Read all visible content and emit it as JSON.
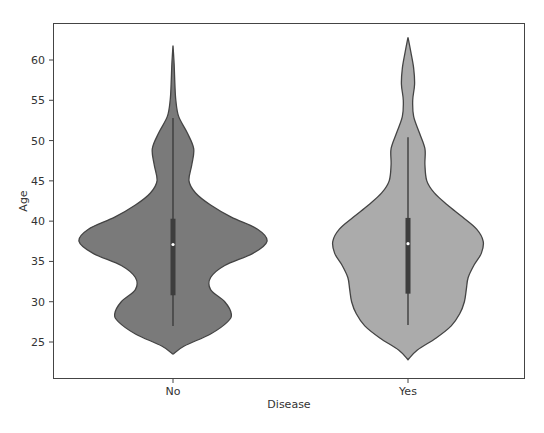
{
  "chart_data": {
    "type": "violin",
    "title": "",
    "xlabel": "Disease",
    "ylabel": "Age",
    "categories": [
      "No",
      "Yes"
    ],
    "ylim": [
      20.5,
      65.2
    ],
    "yticks": [
      25,
      30,
      35,
      40,
      45,
      50,
      55,
      60
    ],
    "grid": false,
    "legend": null,
    "series": [
      {
        "name": "No",
        "color": "#7a7a7a",
        "min_extent": 23.5,
        "max_extent": 61.8,
        "whisker_low": 27.0,
        "q1": 30.8,
        "median": 37.1,
        "q3": 40.3,
        "whisker_high": 52.8,
        "density_profile": [
          [
            23.5,
            0.0
          ],
          [
            24.5,
            0.12
          ],
          [
            26.0,
            0.4
          ],
          [
            27.5,
            0.58
          ],
          [
            28.5,
            0.62
          ],
          [
            30.0,
            0.55
          ],
          [
            31.5,
            0.4
          ],
          [
            33.0,
            0.4
          ],
          [
            34.5,
            0.55
          ],
          [
            36.0,
            0.85
          ],
          [
            37.5,
            1.0
          ],
          [
            39.0,
            0.9
          ],
          [
            40.5,
            0.62
          ],
          [
            42.0,
            0.4
          ],
          [
            43.5,
            0.24
          ],
          [
            45.0,
            0.17
          ],
          [
            47.0,
            0.2
          ],
          [
            49.0,
            0.22
          ],
          [
            51.0,
            0.15
          ],
          [
            53.0,
            0.06
          ],
          [
            55.0,
            0.03
          ],
          [
            57.0,
            0.02
          ],
          [
            59.5,
            0.012
          ],
          [
            61.8,
            0.0
          ]
        ]
      },
      {
        "name": "Yes",
        "color": "#ababab",
        "min_extent": 22.8,
        "max_extent": 62.8,
        "whisker_low": 27.1,
        "q1": 31.0,
        "median": 37.2,
        "q3": 40.4,
        "whisker_high": 50.4,
        "density_profile": [
          [
            22.8,
            0.0
          ],
          [
            24.0,
            0.1
          ],
          [
            25.5,
            0.3
          ],
          [
            27.0,
            0.46
          ],
          [
            28.5,
            0.55
          ],
          [
            30.0,
            0.6
          ],
          [
            31.5,
            0.62
          ],
          [
            33.0,
            0.64
          ],
          [
            34.5,
            0.7
          ],
          [
            36.0,
            0.78
          ],
          [
            37.5,
            0.8
          ],
          [
            39.0,
            0.73
          ],
          [
            40.5,
            0.58
          ],
          [
            42.0,
            0.42
          ],
          [
            43.5,
            0.28
          ],
          [
            45.0,
            0.2
          ],
          [
            47.0,
            0.18
          ],
          [
            49.0,
            0.18
          ],
          [
            51.0,
            0.12
          ],
          [
            53.0,
            0.06
          ],
          [
            55.0,
            0.05
          ],
          [
            57.0,
            0.07
          ],
          [
            59.0,
            0.06
          ],
          [
            61.0,
            0.03
          ],
          [
            62.8,
            0.0
          ]
        ]
      }
    ]
  }
}
